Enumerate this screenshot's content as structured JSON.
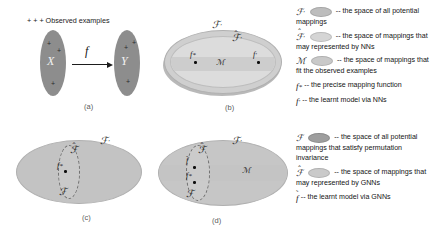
{
  "figure": {
    "panels": [
      {
        "id": "a",
        "label": "(a)",
        "annotation": "+ + + Observed examples",
        "domain_label": "X",
        "codomain_label": "Y",
        "map_label": "f"
      },
      {
        "id": "b",
        "label": "(b)",
        "labels": {
          "outer": "F'",
          "inner": "F̂'",
          "band": "M",
          "point_star": "f*",
          "point_prime": "f'"
        }
      },
      {
        "id": "c",
        "label": "(c)",
        "labels": {
          "outer": "F'",
          "hat": "F̂",
          "base": "F",
          "point_star": "f*"
        }
      },
      {
        "id": "d",
        "label": "(d)",
        "labels": {
          "outer": "F'",
          "hat": "F̂",
          "base": "F",
          "band": "M",
          "point_tilde": "f̃",
          "point_star": "f*"
        }
      }
    ]
  },
  "legend_top": {
    "rows": [
      {
        "symbol": "F'",
        "swatch_color": "#bdbdbd",
        "text": "-- the space of all potential mappings"
      },
      {
        "symbol": "F̂'",
        "swatch_color": "#d5d5d5",
        "text": "-- the space of  mappings that may represented by NNs"
      },
      {
        "symbol": "M",
        "swatch_color": "#c9c9c9",
        "text": "-- the space of  mappings that fit the observed examples"
      },
      {
        "symbol": "f*",
        "swatch_color": null,
        "text": "-- the precise mapping function"
      },
      {
        "symbol": "f'",
        "swatch_color": null,
        "text": "-- the learnt model via NNs"
      }
    ]
  },
  "legend_bottom": {
    "rows": [
      {
        "symbol": "F",
        "swatch_color": "#9e9e9e",
        "text": "-- the space of all potential mappings that satisfy permutation invariance"
      },
      {
        "symbol": "F̂",
        "swatch_color": "#cacaca",
        "text": "-- the space of  mappings that may represented by GNNs"
      },
      {
        "symbol": "f̃",
        "swatch_color": null,
        "text": "-- the learnt model via GNNs"
      }
    ]
  },
  "colors": {
    "ellipse_dark": "#8d8d8d",
    "ellipse_outer": "#cfcfcf",
    "ellipse_inner": "#dcdcdc",
    "band": "#cdcdcd",
    "shadow": "#b9b9b9",
    "background": "#ffffff"
  }
}
